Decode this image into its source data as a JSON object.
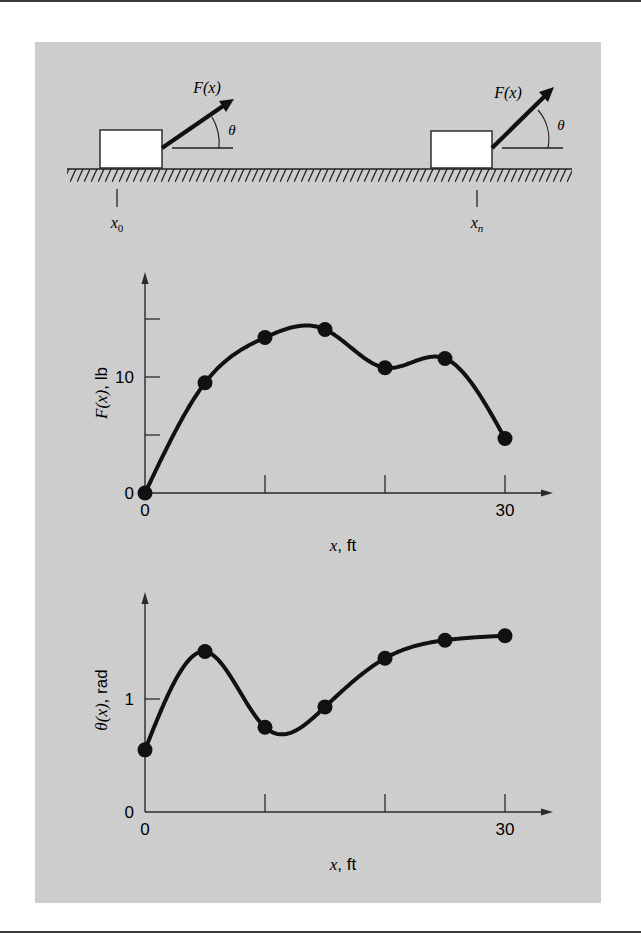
{
  "figure": {
    "colors": {
      "panel": "#cfcfcf",
      "ink": "#111111",
      "box_fill": "#ffffff"
    },
    "diagram": {
      "force_label": "F(x)",
      "angle_label": "θ",
      "start_position": {
        "main": "x",
        "sub": "0"
      },
      "end_position": {
        "main": "x",
        "sub": "n"
      }
    }
  },
  "chart_data": [
    {
      "type": "line",
      "title": "",
      "xlabel": "x, ft",
      "ylabel": "F(x), lb",
      "x": [
        0,
        5,
        10,
        15,
        20,
        25,
        30
      ],
      "series": [
        {
          "name": "F(x)",
          "values": [
            0,
            9.5,
            13.4,
            14.1,
            10.8,
            11.6,
            4.7
          ]
        }
      ],
      "markers": true,
      "smooth": true,
      "xlim": [
        0,
        34
      ],
      "ylim": [
        0,
        19
      ],
      "xticks": [
        0,
        10,
        20,
        30
      ],
      "xtick_labels": [
        "0",
        "",
        "",
        "30"
      ],
      "yticks": [
        0,
        5,
        10,
        15
      ],
      "ytick_labels": [
        "0",
        "",
        "10",
        ""
      ],
      "grid": false,
      "legend": null
    },
    {
      "type": "line",
      "title": "",
      "xlabel": "x, ft",
      "ylabel": "θ(x), rad",
      "x": [
        0,
        5,
        10,
        15,
        20,
        25,
        30
      ],
      "series": [
        {
          "name": "θ(x)",
          "values": [
            0.55,
            1.42,
            0.75,
            0.93,
            1.36,
            1.52,
            1.56
          ]
        }
      ],
      "markers": true,
      "smooth": true,
      "xlim": [
        0,
        34
      ],
      "ylim": [
        0,
        1.95
      ],
      "xticks": [
        0,
        10,
        20,
        30
      ],
      "xtick_labels": [
        "0",
        "",
        "",
        "30"
      ],
      "yticks": [
        0,
        1
      ],
      "ytick_labels": [
        "0",
        "1"
      ],
      "grid": false,
      "legend": null
    }
  ]
}
